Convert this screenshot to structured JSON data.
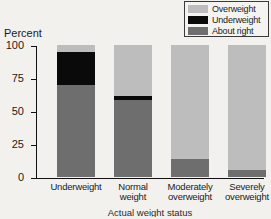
{
  "chart_data": {
    "type": "bar",
    "subtype": "stacked-bar-100",
    "title": "",
    "ylabel": "Percent",
    "xlabel": "Actual weight status",
    "categories": [
      "Underweight",
      "Normal weight",
      "Moderately overweight",
      "Severely overweight"
    ],
    "category_lines": [
      [
        "Underweight"
      ],
      [
        "Normal",
        "weight"
      ],
      [
        "Moderately",
        "overweight"
      ],
      [
        "Severely",
        "overweight"
      ]
    ],
    "ylim": [
      0,
      100
    ],
    "yticks": [
      0,
      25,
      50,
      75,
      100
    ],
    "ytick_labels": [
      "0",
      "25",
      "50",
      "75",
      "100"
    ],
    "grid": false,
    "legend_position": "top-right",
    "series": [
      {
        "name": "Overweight",
        "color": "#bdbdbd",
        "values": [
          5,
          39,
          86,
          95
        ]
      },
      {
        "name": "Underweight",
        "color": "#0a0a0a",
        "values": [
          25,
          3,
          0,
          0
        ]
      },
      {
        "name": "About right",
        "color": "#6e6e6e",
        "values": [
          70,
          58,
          14,
          5
        ]
      }
    ],
    "stack_order_top_to_bottom": [
      "Overweight",
      "Underweight",
      "About right"
    ]
  },
  "legend": {
    "items": [
      {
        "label": "Overweight",
        "color": "#bdbdbd"
      },
      {
        "label": "Underweight",
        "color": "#0a0a0a"
      },
      {
        "label": "About right",
        "color": "#6e6e6e"
      }
    ]
  },
  "axes": {
    "y_title": "Percent",
    "x_title": "Actual weight status"
  },
  "colors": {
    "background": "#f2f1ee",
    "axis": "#111111",
    "overweight": "#bdbdbd",
    "underweight": "#0a0a0a",
    "about_right": "#6e6e6e"
  }
}
